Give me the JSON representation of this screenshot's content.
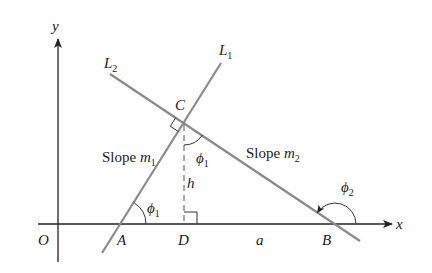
{
  "diagram": {
    "type": "geometry",
    "axes": {
      "x_label": "x",
      "y_label": "y",
      "origin_label": "O"
    },
    "lines": [
      {
        "id": "L1",
        "label": "L",
        "subscript": "1",
        "slope_text": "Slope ",
        "slope_var": "m",
        "slope_sub": "1",
        "color": "#8a8a8a"
      },
      {
        "id": "L2",
        "label": "L",
        "subscript": "2",
        "slope_text": "Slope ",
        "slope_var": "m",
        "slope_sub": "2",
        "color": "#8a8a8a"
      }
    ],
    "points": {
      "A": "A",
      "B": "B",
      "C": "C",
      "D": "D"
    },
    "segments": {
      "height": "h",
      "base": "a"
    },
    "angles": {
      "phi1_at_A": {
        "symbol": "ϕ",
        "sub": "1"
      },
      "phi1_at_C": {
        "symbol": "ϕ",
        "sub": "1"
      },
      "phi2_at_B": {
        "symbol": "ϕ",
        "sub": "2"
      }
    }
  }
}
